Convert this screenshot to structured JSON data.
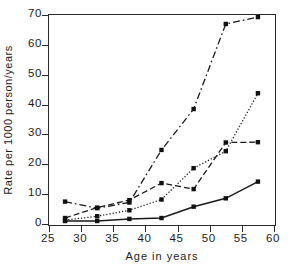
{
  "chart_data": {
    "type": "line",
    "title": "",
    "xlabel": "Age in years",
    "ylabel": "Rate per 1000 person/years",
    "xlim": [
      25,
      60
    ],
    "ylim": [
      0,
      70
    ],
    "xticks": [
      25,
      30,
      35,
      40,
      45,
      50,
      55,
      60
    ],
    "yticks": [
      0,
      10,
      20,
      30,
      40,
      50,
      60,
      70
    ],
    "grid": false,
    "legend": "none",
    "marker": "filled-square",
    "x": [
      27.5,
      32.5,
      37.5,
      42.5,
      47.5,
      52.5,
      57.5
    ],
    "series": [
      {
        "name": "series-1-dashdot-highest",
        "linestyle": "dash-dot",
        "values": [
          7.5,
          5.3,
          7.2,
          24.8,
          38.5,
          67.0,
          69.3
        ]
      },
      {
        "name": "series-2-dashed-upper",
        "linestyle": "long-dash",
        "values": [
          2.0,
          5.5,
          8.0,
          13.7,
          11.7,
          27.3,
          27.4
        ]
      },
      {
        "name": "series-3-dotted",
        "linestyle": "dotted",
        "values": [
          1.3,
          2.6,
          4.6,
          8.2,
          18.7,
          24.4,
          43.8
        ]
      },
      {
        "name": "series-4-solid-lowest",
        "linestyle": "solid",
        "values": [
          1.0,
          1.0,
          1.7,
          2.0,
          5.8,
          8.6,
          14.2
        ]
      }
    ]
  },
  "axes": {
    "y_tick_labels": [
      "0",
      "10",
      "20",
      "30",
      "40",
      "50",
      "60",
      "70"
    ],
    "x_tick_labels": [
      "25",
      "30",
      "35",
      "40",
      "45",
      "50",
      "55",
      "60"
    ]
  }
}
